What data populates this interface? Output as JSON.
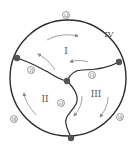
{
  "diagram": {
    "regions": {
      "r1": "I",
      "r2": "II",
      "r3": "III",
      "r4": "IV"
    },
    "boundary_labels": {
      "ga": "가",
      "na": "나",
      "da": "다",
      "ra": "라",
      "ma": "마",
      "ba": "바"
    },
    "colors": {
      "line": "#2a2a2a",
      "node": "#555555",
      "arrow": "#888888",
      "text": "#555555"
    }
  }
}
